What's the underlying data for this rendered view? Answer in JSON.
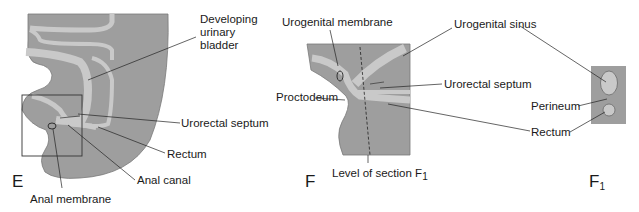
{
  "figure": {
    "panels": [
      {
        "id": "E",
        "letter": "E",
        "labels": {
          "developing_line1": "Developing",
          "developing_line2": "urinary",
          "developing_line3": "bladder",
          "urorectal_septum": "Urorectal septum",
          "rectum": "Rectum",
          "anal_canal": "Anal canal",
          "anal_membrane": "Anal membrane"
        }
      },
      {
        "id": "F",
        "letter": "F",
        "labels": {
          "urogenital_membrane": "Urogenital membrane",
          "urogenital_sinus": "Urogenital sinus",
          "urorectal_septum": "Urorectal septum",
          "proctodeum": "Proctodeum",
          "rectum": "Rectum",
          "level_of_section": "Level of section F",
          "level_sub": "1"
        }
      },
      {
        "id": "F1",
        "letter": "F",
        "letter_sub": "1",
        "labels": {
          "perineum": "Perineum",
          "rectum": "Rectum"
        }
      }
    ],
    "colors": {
      "tissue_dark": "#9a9a9a",
      "tissue_light": "#c8c8c8",
      "outline": "#6a6a6a",
      "leader": "#222222"
    }
  }
}
